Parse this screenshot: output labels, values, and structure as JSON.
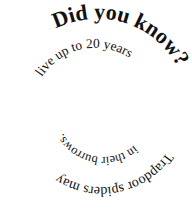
{
  "graphic": {
    "title": "Did you know?",
    "segments": [
      {
        "id": "s1",
        "text": "Did you know?",
        "weight": "bold",
        "size_level": "large"
      },
      {
        "id": "s2",
        "text": " Trapdoor spiders may",
        "weight": "normal",
        "size_level": "medium"
      },
      {
        "id": "s3",
        "text": " live up to 20 years",
        "weight": "normal",
        "size_level": "medium"
      },
      {
        "id": "s4",
        "text": " in their burrows.",
        "weight": "normal",
        "size_level": "small"
      }
    ],
    "text_color": "#111111",
    "background_color": "#ffffff"
  }
}
